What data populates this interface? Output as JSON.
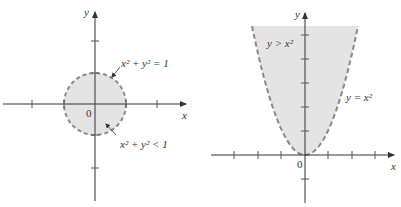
{
  "figures": [
    {
      "id": "disk",
      "axis_labels": {
        "x": "x",
        "y": "y"
      },
      "origin_label": "0",
      "boundary_label_base": "x",
      "boundary_label": "x² + y² = 1",
      "region_label": "x² + y² < 1",
      "colors": {
        "fill": "#e4e4e4",
        "boundary": "#8a8a8a",
        "axis": "#333333"
      }
    },
    {
      "id": "parabola-region",
      "axis_labels": {
        "x": "x",
        "y": "y"
      },
      "origin_label": "0",
      "boundary_label": "y = x²",
      "region_label": "y > x²",
      "colors": {
        "fill": "#e4e4e4",
        "boundary": "#8a8a8a",
        "axis": "#333333"
      }
    }
  ]
}
